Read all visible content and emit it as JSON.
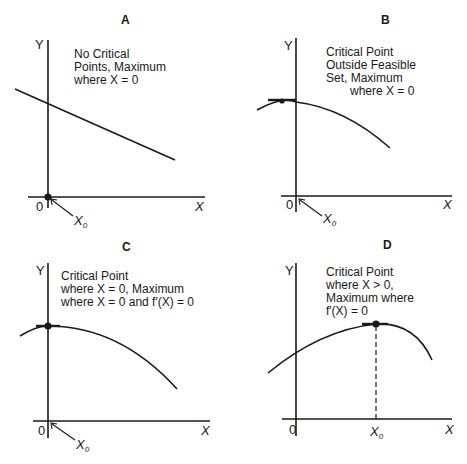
{
  "panels": {
    "A": {
      "title": "A",
      "caption": [
        "No Critical",
        "Points, Maximum",
        "where X = 0"
      ],
      "x_axis_label": "X",
      "y_axis_label": "Y",
      "origin_label": "0",
      "x0_label": "X",
      "x0_subscript": "0",
      "curve": "linear decreasing"
    },
    "B": {
      "title": "B",
      "caption": [
        "Critical Point",
        "Outside Feasible",
        "Set, Maximum",
        "where X = 0"
      ],
      "x_axis_label": "X",
      "y_axis_label": "Y",
      "origin_label": "0",
      "x0_label": "X",
      "x0_subscript": "0",
      "curve": "concave, peak left of Y axis"
    },
    "C": {
      "title": "C",
      "caption": [
        "Critical Point",
        "where X = 0, Maximum",
        "where X = 0 and f′(X) = 0"
      ],
      "x_axis_label": "X",
      "y_axis_label": "Y",
      "origin_label": "0",
      "x0_label": "X",
      "x0_subscript": "0",
      "curve": "concave, peak on Y axis"
    },
    "D": {
      "title": "D",
      "caption": [
        "Critical Point",
        "where X > 0,",
        "Maximum where",
        "f′(X) = 0"
      ],
      "x_axis_label": "X",
      "y_axis_label": "Y",
      "origin_label": "0",
      "x0_label": "X",
      "x0_subscript": "0",
      "curve": "concave, interior peak at X0"
    }
  },
  "colors": {
    "ink": "#1a1a1a",
    "background": "#ffffff"
  }
}
